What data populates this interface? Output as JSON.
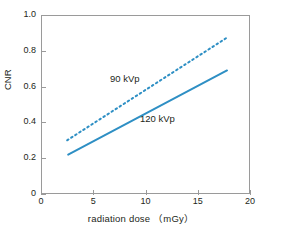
{
  "chart_data": {
    "type": "line",
    "title": "",
    "xlabel": "radiation dose （mGy）",
    "ylabel": "CNR",
    "xlim": [
      0,
      20
    ],
    "ylim": [
      0,
      1.0
    ],
    "xticks": [
      0,
      5,
      10,
      15,
      20
    ],
    "xtick_labels": [
      "0",
      "5",
      "10",
      "15",
      "20"
    ],
    "yticks": [
      0,
      0.2,
      0.4,
      0.6,
      0.8,
      1.0
    ],
    "ytick_labels": [
      "0",
      "0.2",
      "0.4",
      "0.6",
      "0.8",
      "1.0"
    ],
    "grid": false,
    "legend_position": "inline-annotation",
    "line_color": "#2e8fc4",
    "frame_color": "#9a9a9a",
    "series": [
      {
        "name": "90 kVp",
        "style": "dotted",
        "color": "#2e8fc4",
        "x": [
          2.5,
          17.7
        ],
        "y": [
          0.3,
          0.87
        ],
        "label": "90 kVp"
      },
      {
        "name": "120 kVp",
        "style": "solid",
        "color": "#2e8fc4",
        "x": [
          2.6,
          17.8
        ],
        "y": [
          0.22,
          0.69
        ],
        "label": "120 kVp"
      }
    ]
  },
  "axes": {
    "y_title": "CNR",
    "x_title": "radiation dose （mGy）"
  }
}
